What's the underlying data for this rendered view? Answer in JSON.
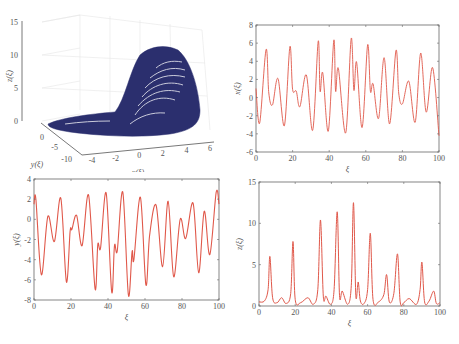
{
  "chart_data": [
    {
      "id": "phase3d",
      "type": "scatter3d",
      "title": "",
      "xlabel": "x(ξ)",
      "ylabel": "y(ξ)",
      "zlabel": "z(ξ)",
      "x_ticks": [
        "-4",
        "-2",
        "0",
        "2",
        "4",
        "6"
      ],
      "y_ticks": [
        "0",
        "-5",
        "-10"
      ],
      "z_ticks": [
        "0",
        "5",
        "10",
        "15"
      ],
      "xlim": [
        -4,
        6
      ],
      "ylim": [
        -10,
        2
      ],
      "zlim": [
        0,
        15
      ],
      "grid": true,
      "color": "#2b2f6e",
      "description": "Dense 3D attractor trajectory: flat lobe near z=0 extending left, rising dome up to z≈12 around x≈2..5"
    },
    {
      "id": "x_series",
      "type": "line",
      "title": "",
      "xlabel": "ξ",
      "ylabel": "x(ξ)",
      "xlim": [
        0,
        100
      ],
      "ylim": [
        -6,
        8
      ],
      "x_ticks": [
        "0",
        "20",
        "40",
        "60",
        "80",
        "100"
      ],
      "y_ticks": [
        "-6",
        "-4",
        "-2",
        "0",
        "2",
        "4",
        "6",
        "8"
      ],
      "color": "#e0584a",
      "x": [
        0,
        2,
        5.5,
        7,
        9,
        12,
        15.5,
        18.5,
        20,
        22,
        24,
        27.5,
        31,
        34,
        35,
        36.5,
        39.5,
        42.5,
        43.5,
        45,
        49,
        52,
        53.5,
        55,
        58,
        61,
        62.5,
        64,
        67,
        70,
        73,
        76.5,
        78,
        80,
        83.5,
        87,
        90,
        93,
        96.5,
        100
      ],
      "values": [
        1.0,
        -2.8,
        5.3,
        0.5,
        -0.8,
        2.1,
        -3.1,
        5.6,
        0.9,
        0.7,
        -1.0,
        2.5,
        -3.6,
        6.2,
        0.7,
        2.7,
        -3.7,
        6.3,
        0.7,
        3.2,
        -3.9,
        6.5,
        0.8,
        3.9,
        -3.3,
        5.8,
        0.7,
        1.5,
        -2.3,
        4.4,
        -2.9,
        5.2,
        0.5,
        -0.7,
        1.8,
        -2.7,
        4.9,
        -1.6,
        3.3,
        -4.2
      ]
    },
    {
      "id": "y_series",
      "type": "line",
      "title": "",
      "xlabel": "ξ",
      "ylabel": "y(ξ)",
      "xlim": [
        0,
        100
      ],
      "ylim": [
        -8,
        4
      ],
      "x_ticks": [
        "0",
        "20",
        "40",
        "60",
        "80",
        "100"
      ],
      "y_ticks": [
        "-8",
        "-6",
        "-4",
        "-2",
        "0",
        "2",
        "4"
      ],
      "color": "#e0584a",
      "x": [
        0,
        1,
        4,
        7.5,
        11,
        14.5,
        17.5,
        19.5,
        20.5,
        23,
        26,
        29.5,
        33,
        34.5,
        36,
        39,
        42,
        43.5,
        45,
        48,
        51,
        53,
        54,
        57.5,
        60.5,
        62.5,
        66,
        69.5,
        72.5,
        75.5,
        79,
        82,
        86,
        89,
        92,
        95,
        98.5,
        100
      ],
      "values": [
        1.5,
        2.0,
        -5.5,
        0.3,
        -2.2,
        2.1,
        -6.2,
        -1.2,
        -1.0,
        0.4,
        -2.6,
        2.4,
        -6.9,
        -2.5,
        -2.8,
        2.6,
        -7.2,
        -2.6,
        -3.1,
        2.7,
        -7.5,
        -3.2,
        -4.0,
        2.2,
        -6.5,
        -1.6,
        1.4,
        -4.7,
        1.8,
        -5.7,
        0.0,
        -1.9,
        1.6,
        -5.3,
        0.8,
        -3.5,
        2.7,
        1.5
      ]
    },
    {
      "id": "z_series",
      "type": "line",
      "title": "",
      "xlabel": "ξ",
      "ylabel": "z(ξ)",
      "xlim": [
        0,
        100
      ],
      "ylim": [
        0,
        15
      ],
      "x_ticks": [
        "0",
        "20",
        "40",
        "60",
        "80",
        "100"
      ],
      "y_ticks": [
        "0",
        "5",
        "10",
        "15"
      ],
      "color": "#e0584a",
      "x": [
        0,
        3,
        5,
        6,
        7.5,
        10,
        12.5,
        15,
        17.5,
        18.8,
        20,
        23,
        27,
        30,
        32.5,
        34,
        35.5,
        37,
        39.5,
        41.5,
        43.2,
        44.5,
        46,
        49,
        51,
        52.2,
        53.5,
        54.8,
        56,
        58,
        60,
        61.5,
        63,
        66,
        69,
        70.5,
        72,
        74.5,
        76.5,
        78,
        80,
        83,
        87,
        89,
        90,
        91.5,
        94,
        96.5,
        98,
        100
      ],
      "values": [
        0.5,
        0.6,
        2.0,
        6.0,
        1.0,
        0.4,
        1.0,
        0.3,
        1.5,
        7.8,
        0.8,
        0.4,
        1.0,
        0.2,
        2.0,
        10.4,
        1.2,
        1.2,
        0.2,
        2.0,
        11.4,
        1.3,
        1.8,
        0.2,
        2.5,
        12.5,
        1.3,
        2.9,
        0.6,
        0.3,
        2.0,
        8.8,
        0.8,
        0.5,
        1.4,
        3.8,
        0.5,
        1.5,
        6.3,
        0.5,
        0.4,
        0.9,
        0.2,
        2.0,
        5.3,
        0.5,
        0.6,
        1.8,
        0.3,
        0.4
      ]
    }
  ]
}
